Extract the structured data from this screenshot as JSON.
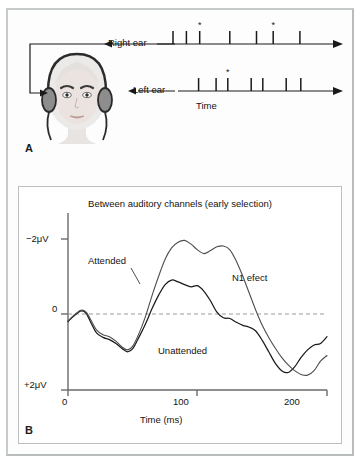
{
  "figure": {
    "panel_a": {
      "letter": "A",
      "right_ear_label": "Right ear",
      "left_ear_label": "Left ear",
      "time_label": "Time",
      "head_icon": "head-with-headphones-icon",
      "right_ear_events": [
        {
          "t": 0.06,
          "starred": false
        },
        {
          "t": 0.14,
          "starred": false
        },
        {
          "t": 0.22,
          "starred": true
        },
        {
          "t": 0.4,
          "starred": false
        },
        {
          "t": 0.56,
          "starred": false
        },
        {
          "t": 0.66,
          "starred": true
        },
        {
          "t": 0.82,
          "starred": false
        }
      ],
      "left_ear_events": [
        {
          "t": 0.1,
          "starred": false
        },
        {
          "t": 0.22,
          "starred": false
        },
        {
          "t": 0.3,
          "starred": true
        },
        {
          "t": 0.46,
          "starred": false
        },
        {
          "t": 0.54,
          "starred": false
        },
        {
          "t": 0.7,
          "starred": false
        },
        {
          "t": 0.8,
          "starred": false
        }
      ]
    },
    "panel_b": {
      "letter": "B"
    }
  },
  "chart_data": {
    "type": "line",
    "title": "Between auditory channels (early selection)",
    "xlabel": "Time (ms)",
    "ylabel": "",
    "xlim": [
      0,
      200
    ],
    "ylim": [
      2,
      -2
    ],
    "xticks": [
      0,
      100,
      200
    ],
    "xticklabels": [
      "0",
      "100",
      "200"
    ],
    "yticks": [
      -2,
      0,
      2
    ],
    "yticklabels": [
      "−2μV",
      "0",
      "+2μV"
    ],
    "y_inverted": true,
    "grid": false,
    "zero_line": "dashed",
    "annotations": [
      "N1 efect"
    ],
    "legend_position": "inline-labels",
    "series": [
      {
        "name": "Attended",
        "x": [
          0,
          5,
          10,
          14,
          18,
          22,
          27,
          32,
          37,
          42,
          46,
          50,
          55,
          60,
          65,
          70,
          75,
          80,
          85,
          90,
          95,
          100,
          105,
          110,
          115,
          120,
          125,
          130,
          135,
          140,
          145,
          150,
          155,
          160,
          165,
          170,
          175,
          180,
          185,
          190,
          195,
          200
        ],
        "values": [
          0.18,
          0.02,
          -0.1,
          -0.05,
          0.18,
          0.42,
          0.55,
          0.6,
          0.72,
          0.88,
          0.95,
          0.85,
          0.5,
          0.05,
          -0.5,
          -1.0,
          -1.45,
          -1.75,
          -1.9,
          -1.95,
          -1.85,
          -1.7,
          -1.6,
          -1.68,
          -1.78,
          -1.8,
          -1.7,
          -1.4,
          -1.0,
          -0.55,
          -0.1,
          0.3,
          0.62,
          0.9,
          1.15,
          1.35,
          1.5,
          1.6,
          1.62,
          1.5,
          1.25,
          1.1
        ]
      },
      {
        "name": "Unattended",
        "x": [
          0,
          5,
          10,
          14,
          18,
          22,
          27,
          32,
          37,
          42,
          46,
          50,
          55,
          60,
          65,
          70,
          75,
          80,
          85,
          90,
          95,
          100,
          105,
          110,
          115,
          120,
          125,
          130,
          135,
          140,
          145,
          150,
          155,
          160,
          165,
          170,
          175,
          180,
          185,
          190,
          195,
          200
        ],
        "values": [
          0.2,
          0.04,
          -0.08,
          -0.02,
          0.25,
          0.5,
          0.62,
          0.68,
          0.78,
          0.92,
          1.0,
          0.92,
          0.6,
          0.25,
          -0.15,
          -0.5,
          -0.78,
          -0.9,
          -0.85,
          -0.78,
          -0.72,
          -0.75,
          -0.6,
          -0.35,
          -0.05,
          0.1,
          0.12,
          0.22,
          0.3,
          0.35,
          0.45,
          0.7,
          1.0,
          1.3,
          1.5,
          1.55,
          1.4,
          1.15,
          0.95,
          0.82,
          0.78,
          0.6
        ]
      }
    ]
  }
}
